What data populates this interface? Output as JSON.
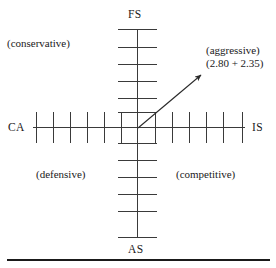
{
  "diagram": {
    "axes": {
      "top_label": "FS",
      "bottom_label": "AS",
      "left_label": "CA",
      "right_label": "IS"
    },
    "quadrants": {
      "top_left": "(conservative)",
      "top_right": "(aggressive)",
      "bottom_left": "(defensive)",
      "bottom_right": "(competitive)"
    },
    "vector": {
      "label": "(aggressive)",
      "coordinates_text": "(2.80 + 2.35)",
      "x_value": 2.8,
      "y_value": 2.35,
      "origin": [
        138,
        128
      ],
      "tip": [
        203,
        73
      ]
    },
    "ticks": {
      "up_count": 6,
      "down_count": 6,
      "left_count": 6,
      "right_count": 6,
      "up_y": [
        29,
        47,
        64,
        81,
        98,
        112
      ],
      "down_y": [
        143,
        160,
        177,
        194,
        211,
        237
      ],
      "left_x": [
        36,
        53,
        70,
        87,
        104,
        121
      ],
      "right_x": [
        155,
        172,
        189,
        206,
        223,
        242
      ]
    },
    "colors": {
      "line": "#3a3a3a",
      "text": "#1a1a1a",
      "background": "#ffffff",
      "rule": "#1a1a1a"
    }
  }
}
